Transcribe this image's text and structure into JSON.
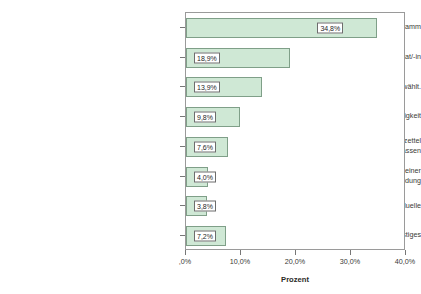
{
  "chart_data": {
    "type": "bar",
    "orientation": "horizontal",
    "title": "",
    "xlabel": "Prozent",
    "ylabel": "",
    "xlim": [
      0,
      40
    ],
    "grid": false,
    "legend": null,
    "xtick_labels": [
      ",0%",
      "10,0%",
      "20,0%",
      "30,0%",
      "40,0%"
    ],
    "xtick_values": [
      0,
      10,
      20,
      30,
      40
    ],
    "categories": [
      "Das Parteiprogramm",
      "Der/die Spitzenkandidat/-in",
      "Ich habe schon immer diese Partei gewählt.",
      "Meine eigene Parteizugehörigkeit",
      "Ich wollte den anderen Parteien einen Denkzettel\nverpassen",
      "Ich erwarte mir einen persönlichen Vorteil meiner\nWahlentscheidung",
      "Eines der Fernsehduelle",
      "Sonstiges"
    ],
    "values": [
      34.8,
      18.9,
      13.9,
      9.8,
      7.6,
      4.0,
      3.8,
      7.2
    ],
    "value_labels": [
      "34,8%",
      "18,9%",
      "13,9%",
      "9,8%",
      "7,6%",
      "4,0%",
      "3,8%",
      "7,2%"
    ],
    "colors": {
      "bar_fill": "#cfe8d5",
      "bar_border": "#7f9f88",
      "frame": "#9a9a9a",
      "text": "#33332f",
      "label_box_border": "#6d6d6d",
      "label_box_fill": "#ffffff"
    }
  }
}
